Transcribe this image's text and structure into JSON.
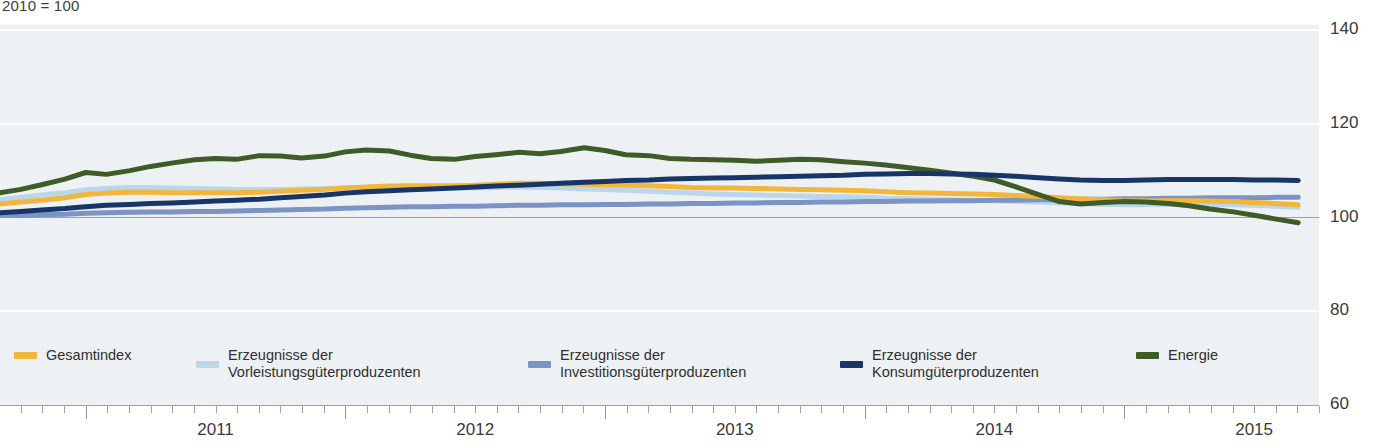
{
  "chart_data": {
    "type": "line",
    "title": "",
    "subtitle": "2010 = 100",
    "xlabel": "",
    "ylabel": "",
    "ylim": [
      60,
      140
    ],
    "yticks": [
      140,
      120,
      100,
      80,
      60
    ],
    "xlim": [
      2010.67,
      2015.75
    ],
    "xticks": [
      2011,
      2012,
      2013,
      2014,
      2015
    ],
    "xtick_labels": [
      "2011",
      "2012",
      "2013",
      "2014",
      "2015"
    ],
    "grid": true,
    "legend_position": "bottom",
    "x": [
      2010.67,
      2010.75,
      2010.83,
      2010.92,
      2011.0,
      2011.08,
      2011.17,
      2011.25,
      2011.33,
      2011.42,
      2011.5,
      2011.58,
      2011.67,
      2011.75,
      2011.83,
      2011.92,
      2012.0,
      2012.08,
      2012.17,
      2012.25,
      2012.33,
      2012.42,
      2012.5,
      2012.58,
      2012.67,
      2012.75,
      2012.83,
      2012.92,
      2013.0,
      2013.08,
      2013.17,
      2013.25,
      2013.33,
      2013.42,
      2013.5,
      2013.58,
      2013.67,
      2013.75,
      2013.83,
      2013.92,
      2014.0,
      2014.08,
      2014.17,
      2014.25,
      2014.33,
      2014.42,
      2014.5,
      2014.58,
      2014.67,
      2014.75,
      2014.83,
      2014.92,
      2015.0,
      2015.08,
      2015.17,
      2015.25,
      2015.33,
      2015.42,
      2015.5,
      2015.58,
      2015.67
    ],
    "series": [
      {
        "name": "Gesamtindex",
        "key": "gesamtindex",
        "color": "#f2b63c",
        "values": [
          102.9,
          103.3,
          103.7,
          104.2,
          104.9,
          105.2,
          105.4,
          105.4,
          105.3,
          105.3,
          105.3,
          105.3,
          105.4,
          105.6,
          105.8,
          106.0,
          106.3,
          106.5,
          106.7,
          106.8,
          106.8,
          106.8,
          106.9,
          107.1,
          107.3,
          107.3,
          107.2,
          107.1,
          107.0,
          106.9,
          106.8,
          106.6,
          106.4,
          106.3,
          106.3,
          106.2,
          106.1,
          106.0,
          105.9,
          105.8,
          105.7,
          105.5,
          105.3,
          105.2,
          105.1,
          105.0,
          104.9,
          104.7,
          104.5,
          104.2,
          104.0,
          103.8,
          103.6,
          103.6,
          103.6,
          103.6,
          103.5,
          103.4,
          103.2,
          103.0,
          102.7
        ]
      },
      {
        "name": "Erzeugnisse der Vorleistungsgüterproduzenten",
        "key": "vorleistung",
        "color": "#b9d6ea",
        "values": [
          103.8,
          104.3,
          104.8,
          105.3,
          105.9,
          106.2,
          106.4,
          106.4,
          106.3,
          106.2,
          106.1,
          106.0,
          106.0,
          106.0,
          106.1,
          106.2,
          106.3,
          106.4,
          106.5,
          106.5,
          106.4,
          106.3,
          106.3,
          106.4,
          106.5,
          106.4,
          106.3,
          106.1,
          106.0,
          105.8,
          105.6,
          105.4,
          105.2,
          105.0,
          104.9,
          104.8,
          104.7,
          104.6,
          104.5,
          104.4,
          104.3,
          104.1,
          104.0,
          103.9,
          103.8,
          103.7,
          103.6,
          103.4,
          103.3,
          103.1,
          103.0,
          102.8,
          102.7,
          102.7,
          102.8,
          102.8,
          102.8,
          102.7,
          102.6,
          102.4,
          102.2
        ]
      },
      {
        "name": "Erzeugnisse der Investitionsgüterproduzenten",
        "key": "investition",
        "color": "#7c93c6",
        "values": [
          100.4,
          100.5,
          100.6,
          100.7,
          100.9,
          101.0,
          101.1,
          101.2,
          101.2,
          101.3,
          101.3,
          101.4,
          101.5,
          101.6,
          101.7,
          101.8,
          102.0,
          102.1,
          102.2,
          102.3,
          102.3,
          102.4,
          102.4,
          102.5,
          102.6,
          102.6,
          102.7,
          102.7,
          102.8,
          102.8,
          102.9,
          102.9,
          103.0,
          103.0,
          103.1,
          103.1,
          103.2,
          103.2,
          103.3,
          103.3,
          103.4,
          103.4,
          103.5,
          103.5,
          103.6,
          103.6,
          103.7,
          103.7,
          103.8,
          103.8,
          103.9,
          103.9,
          104.0,
          104.0,
          104.1,
          104.1,
          104.2,
          104.2,
          104.2,
          104.3,
          104.3
        ]
      },
      {
        "name": "Erzeugnisse der Konsumgüterproduzenten",
        "key": "konsum",
        "color": "#183567",
        "values": [
          101.0,
          101.3,
          101.6,
          101.9,
          102.3,
          102.6,
          102.8,
          103.0,
          103.1,
          103.3,
          103.5,
          103.7,
          103.9,
          104.2,
          104.5,
          104.8,
          105.2,
          105.5,
          105.7,
          105.9,
          106.1,
          106.3,
          106.5,
          106.7,
          106.9,
          107.1,
          107.3,
          107.5,
          107.7,
          107.9,
          108.0,
          108.2,
          108.3,
          108.4,
          108.5,
          108.6,
          108.7,
          108.8,
          108.9,
          109.0,
          109.2,
          109.3,
          109.4,
          109.4,
          109.3,
          109.2,
          109.0,
          108.8,
          108.5,
          108.2,
          108.0,
          107.9,
          107.9,
          108.0,
          108.1,
          108.1,
          108.1,
          108.1,
          108.0,
          108.0,
          107.9
        ]
      },
      {
        "name": "Energie",
        "key": "energie",
        "color": "#3f5b27",
        "values": [
          105.3,
          106.0,
          107.0,
          108.2,
          109.6,
          109.2,
          110.0,
          110.9,
          111.6,
          112.3,
          112.6,
          112.4,
          113.2,
          113.1,
          112.7,
          113.1,
          114.0,
          114.4,
          114.2,
          113.3,
          112.6,
          112.4,
          113.0,
          113.4,
          113.9,
          113.6,
          114.1,
          114.9,
          114.3,
          113.4,
          113.2,
          112.6,
          112.4,
          112.3,
          112.2,
          112.0,
          112.2,
          112.4,
          112.3,
          111.9,
          111.6,
          111.2,
          110.6,
          110.1,
          109.5,
          108.8,
          108.0,
          106.6,
          104.9,
          103.4,
          102.9,
          103.2,
          103.4,
          103.3,
          103.0,
          102.5,
          101.8,
          101.2,
          100.5,
          99.7,
          98.9
        ]
      }
    ]
  },
  "y_axis": {
    "ticks": [
      {
        "label": "140",
        "value": 140
      },
      {
        "label": "120",
        "value": 120
      },
      {
        "label": "100",
        "value": 100
      },
      {
        "label": "80",
        "value": 80
      },
      {
        "label": "60",
        "value": 60
      }
    ]
  },
  "x_axis": {
    "labels": [
      {
        "label": "2011",
        "value": 2011
      },
      {
        "label": "2012",
        "value": 2012
      },
      {
        "label": "2013",
        "value": 2013
      },
      {
        "label": "2014",
        "value": 2014
      },
      {
        "label": "2015",
        "value": 2015
      }
    ]
  },
  "legend": {
    "items": [
      {
        "label": "Gesamtindex",
        "color": "#f2b63c"
      },
      {
        "label": "Erzeugnisse der\nVorleistungsgüterproduzenten",
        "color": "#b9d6ea"
      },
      {
        "label": "Erzeugnisse der\nInvestitionsgüterproduzenten",
        "color": "#7c93c6"
      },
      {
        "label": "Erzeugnisse der\nKonsumgüterproduzenten",
        "color": "#183567"
      },
      {
        "label": "Energie",
        "color": "#3f5b27"
      }
    ]
  },
  "colors": {
    "panel_background": "#eef1f4",
    "gridline": "#ffffff",
    "baseline": "#9aa3ab",
    "axis_text": "#3a3a3a"
  }
}
